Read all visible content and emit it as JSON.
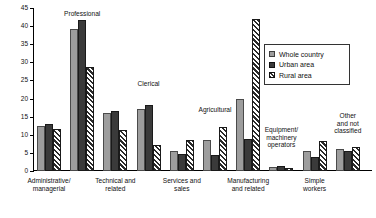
{
  "chart_data": {
    "type": "bar",
    "title": "",
    "subtitle": "",
    "xlabel": "",
    "ylabel": "",
    "ylim": [
      0,
      45
    ],
    "yticks": [
      0,
      5,
      10,
      15,
      20,
      25,
      30,
      35,
      40,
      45
    ],
    "grid": false,
    "legend_position": "upper-right",
    "categories": [
      "Administrative/ managerial",
      "Professional",
      "Technical and related",
      "Clerical",
      "Services and sales",
      "Agricultural",
      "Manufacturing and related",
      "Equipment/ machinery operators",
      "Simple workers",
      "Other and not classified"
    ],
    "series": [
      {
        "name": "Whole country",
        "color": "#9d9d9d",
        "values": [
          12.5,
          39.2,
          16.0,
          17.2,
          5.6,
          8.7,
          19.8,
          1.2,
          5.5,
          6.0
        ]
      },
      {
        "name": "Urban area",
        "color": "#3a3a3a",
        "values": [
          13.0,
          41.8,
          16.6,
          18.3,
          4.7,
          4.4,
          8.8,
          1.4,
          4.0,
          5.6
        ]
      },
      {
        "name": "Rural area",
        "color": "#ffffff",
        "values": [
          11.7,
          28.7,
          11.2,
          7.2,
          8.7,
          12.2,
          42.0,
          0.8,
          8.2,
          6.5
        ]
      }
    ],
    "annotations_above_bars": [
      {
        "text": "Professional",
        "category_index": 1
      },
      {
        "text": "Clerical",
        "category_index": 3
      },
      {
        "text": "Agricultural",
        "category_index": 5
      },
      {
        "text": "Equipment/\nmachinery\noperators",
        "category_index": 7
      },
      {
        "text": "Other\nand not\nclassified",
        "category_index": 9
      }
    ],
    "annotations_below_axis": [
      {
        "text": "Administrative/\nmanagerial",
        "category_index": 0
      },
      {
        "text": "Technical and\nrelated",
        "category_index": 2
      },
      {
        "text": "Services and\nsales",
        "category_index": 4
      },
      {
        "text": "Manufacturing\nand related",
        "category_index": 6
      },
      {
        "text": "Simple\nworkers",
        "category_index": 8
      }
    ]
  },
  "legend": {
    "items": [
      {
        "label": "Whole country"
      },
      {
        "label": "Urban area"
      },
      {
        "label": "Rural area"
      }
    ]
  },
  "axis": {
    "y_tick_labels": [
      "0",
      "5",
      "10",
      "15",
      "20",
      "25",
      "30",
      "35",
      "40",
      "45"
    ]
  }
}
